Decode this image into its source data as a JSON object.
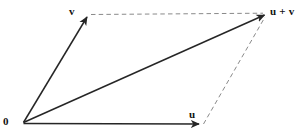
{
  "figure": {
    "background_color": "#ffffff",
    "line_color": "#262626",
    "dash_color": "#8a8a8a",
    "labels": {
      "origin": "0",
      "vector_v": "v",
      "vector_u": "u",
      "vector_sum": "u + v"
    },
    "geometry": {
      "origin": [
        23,
        123
      ],
      "tip_v": [
        88,
        15
      ],
      "tip_u": [
        201,
        124
      ],
      "tip_sum": [
        267,
        14
      ]
    },
    "elements": [
      {
        "name": "vector-v",
        "style": "solid",
        "arrow": true,
        "from": [
          23,
          123
        ],
        "to": [
          88,
          15
        ]
      },
      {
        "name": "vector-u",
        "style": "solid",
        "arrow": true,
        "from": [
          23,
          123
        ],
        "to": [
          201,
          124
        ]
      },
      {
        "name": "vector-u-plus-v",
        "style": "solid",
        "arrow": true,
        "from": [
          23,
          123
        ],
        "to": [
          267,
          14
        ]
      },
      {
        "name": "dashed-v-to-sum",
        "style": "dashed",
        "arrow": false,
        "from": [
          90,
          14
        ],
        "to": [
          264,
          13
        ]
      },
      {
        "name": "dashed-u-to-sum",
        "style": "dashed",
        "arrow": false,
        "from": [
          203,
          124
        ],
        "to": [
          266,
          16
        ]
      }
    ]
  }
}
